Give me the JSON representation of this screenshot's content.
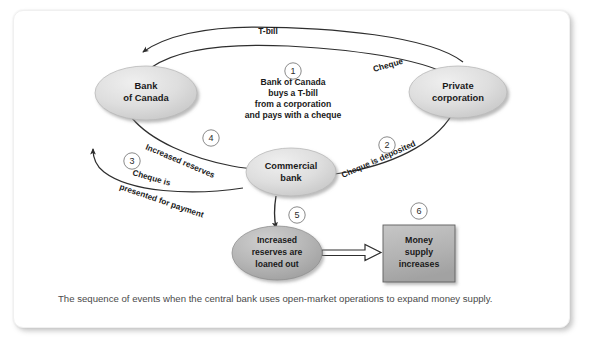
{
  "figure": {
    "caption": "The sequence of events when the central bank uses open-market operations to expand money supply.",
    "nodes": {
      "bank_of_canada": {
        "line1": "Bank",
        "line2": "of Canada"
      },
      "private_corporation": {
        "line1": "Private",
        "line2": "corporation"
      },
      "commercial_bank": {
        "line1": "Commercial",
        "line2": "bank"
      },
      "increased_reserves": {
        "line1": "Increased",
        "line2": "reserves are",
        "line3": "loaned out"
      },
      "money_supply": {
        "line1": "Money",
        "line2": "supply",
        "line3": "increases"
      }
    },
    "center_note": {
      "line1": "Bank of Canada",
      "line2": "buys a T-bill",
      "line3": "from a corporation",
      "line4": "and pays with a cheque"
    },
    "edges": {
      "tbill": "T-bill",
      "cheque": "Cheque",
      "cheque_deposited": "Cheque is  deposited",
      "cheque_presented_line1": "Cheque is",
      "cheque_presented_line2": "presented for payment",
      "increased_reserves": "Increased reserves"
    },
    "steps": {
      "s1": "1",
      "s2": "2",
      "s3": "3",
      "s4": "4",
      "s5": "5",
      "s6": "6"
    },
    "colors": {
      "node_fill_light": "#dcdcdc",
      "node_fill_dark": "#b4b4b4",
      "box_fill": "#b0b0b0",
      "stroke": "#3a3a3a",
      "text": "#1a1a1a",
      "caption_text": "#4a4a4a",
      "frame_border": "#f0f0f0"
    }
  }
}
